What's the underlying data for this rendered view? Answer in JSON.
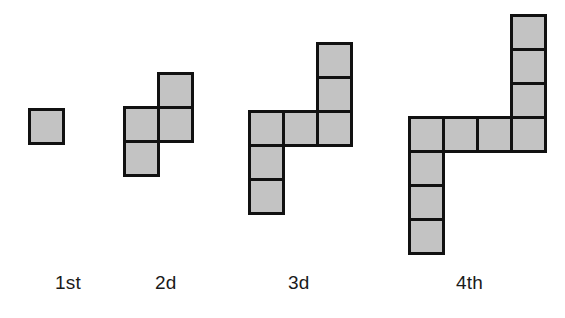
{
  "canvas": {
    "width": 565,
    "height": 318,
    "background_color": "#ffffff"
  },
  "style": {
    "cell_fill_color": "#c3c3c3",
    "cell_border_color": "#111111",
    "cell_border_width_px": 3,
    "label_color": "#1a1a1a",
    "label_font_size_px": 19
  },
  "diagram": {
    "type": "growing-square-tile-pattern",
    "cell_size_px": 37,
    "figures": [
      {
        "id": "figure-1",
        "label": "1st",
        "square_count": 1,
        "label_x": 55,
        "label_y": 272,
        "origin_x": 28,
        "origin_y": 108,
        "cells": [
          {
            "col": 0,
            "row": 0
          }
        ]
      },
      {
        "id": "figure-2",
        "label": "2d",
        "square_count": 4,
        "label_x": 155,
        "label_y": 272,
        "origin_x": 123,
        "origin_y": 72,
        "cells": [
          {
            "col": 1,
            "row": 0
          },
          {
            "col": 0,
            "row": 1
          },
          {
            "col": 1,
            "row": 1
          },
          {
            "col": 0,
            "row": 2
          }
        ]
      },
      {
        "id": "figure-3",
        "label": "3d",
        "square_count": 7,
        "label_x": 288,
        "label_y": 272,
        "origin_x": 248,
        "origin_y": 42,
        "cells": [
          {
            "col": 2,
            "row": 0
          },
          {
            "col": 2,
            "row": 1
          },
          {
            "col": 0,
            "row": 2
          },
          {
            "col": 1,
            "row": 2
          },
          {
            "col": 2,
            "row": 2
          },
          {
            "col": 0,
            "row": 3
          },
          {
            "col": 0,
            "row": 4
          }
        ]
      },
      {
        "id": "figure-4",
        "label": "4th",
        "square_count": 10,
        "label_x": 456,
        "label_y": 272,
        "origin_x": 408,
        "origin_y": 14,
        "cells": [
          {
            "col": 3,
            "row": 0
          },
          {
            "col": 3,
            "row": 1
          },
          {
            "col": 3,
            "row": 2
          },
          {
            "col": 0,
            "row": 3
          },
          {
            "col": 1,
            "row": 3
          },
          {
            "col": 2,
            "row": 3
          },
          {
            "col": 3,
            "row": 3
          },
          {
            "col": 0,
            "row": 4
          },
          {
            "col": 0,
            "row": 5
          },
          {
            "col": 0,
            "row": 6
          }
        ]
      }
    ]
  }
}
